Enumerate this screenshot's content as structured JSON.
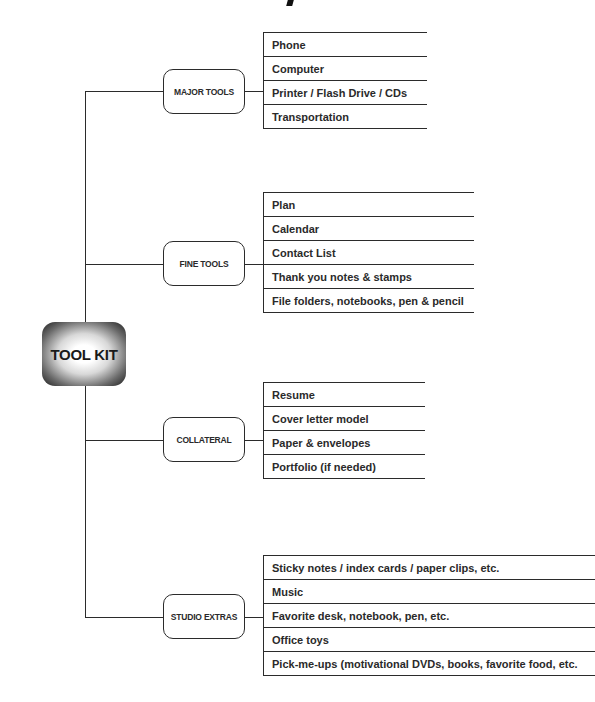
{
  "root": {
    "label": "TOOL KIT"
  },
  "categories": [
    {
      "label": "MAJOR TOOLS",
      "items": [
        "Phone",
        "Computer",
        "Printer / Flash Drive / CDs",
        "Transportation"
      ]
    },
    {
      "label": "FINE TOOLS",
      "items": [
        "Plan",
        "Calendar",
        "Contact List",
        "Thank you notes & stamps",
        "File folders, notebooks, pen & pencil"
      ]
    },
    {
      "label": "COLLATERAL",
      "items": [
        "Resume",
        "Cover letter model",
        "Paper & envelopes",
        "Portfolio (if needed)"
      ]
    },
    {
      "label": "STUDIO EXTRAS",
      "items": [
        "Sticky notes / index cards / paper clips, etc.",
        "Music",
        "Favorite desk, notebook, pen, etc.",
        "Office toys",
        "Pick-me-ups (motivational DVDs, books, favorite food, etc."
      ]
    }
  ]
}
